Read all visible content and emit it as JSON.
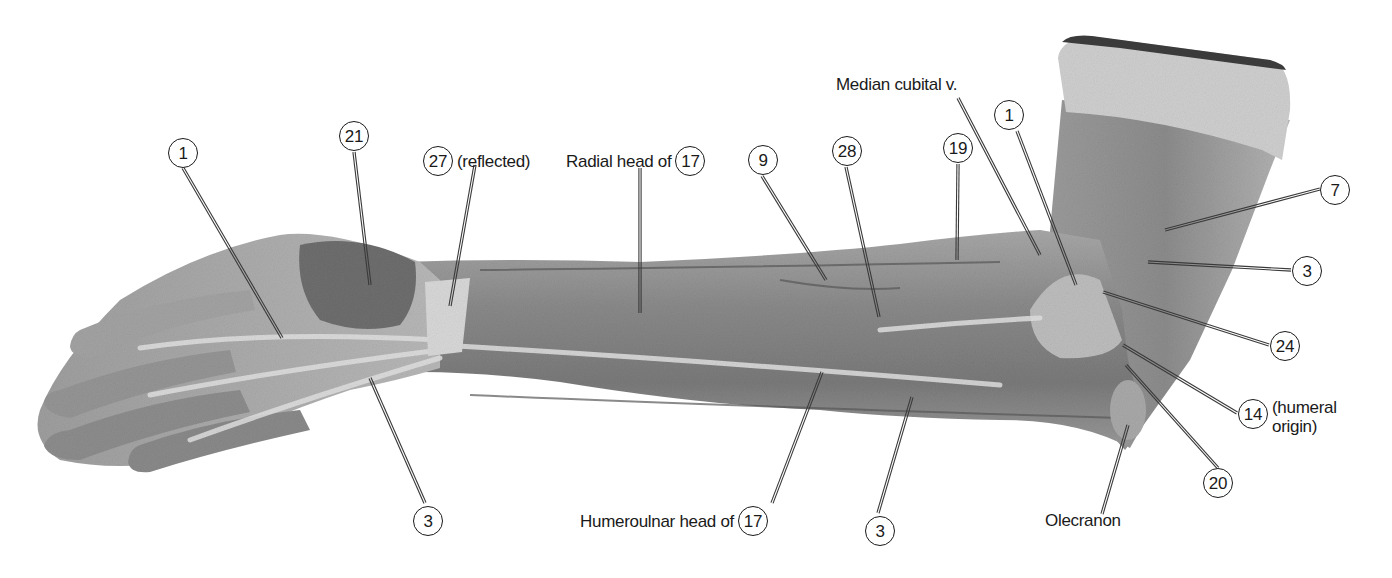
{
  "figure": {
    "type": "anatomical dissection photograph",
    "colors": {
      "background": "#ffffff",
      "tissue_dark": "#6b6b6b",
      "tissue_mid": "#8f8f8f",
      "tissue_light": "#c9c9c9",
      "tendon": "#dcdcdc",
      "label_ink": "#1a1a1a"
    }
  },
  "labels": [
    {
      "id": "l1a",
      "number": "1",
      "prefix": "",
      "suffix": "",
      "x": 168,
      "y": 138
    },
    {
      "id": "l21",
      "number": "21",
      "prefix": "",
      "suffix": "",
      "x": 339,
      "y": 121
    },
    {
      "id": "l27",
      "number": "27",
      "prefix": "",
      "suffix": "(reflected)",
      "x": 423,
      "y": 146
    },
    {
      "id": "l17r",
      "number": "17",
      "prefix": "Radial head of",
      "suffix": "",
      "x": 566,
      "y": 146
    },
    {
      "id": "l9",
      "number": "9",
      "prefix": "",
      "suffix": "",
      "x": 748,
      "y": 145
    },
    {
      "id": "l28",
      "number": "28",
      "prefix": "",
      "suffix": "",
      "x": 832,
      "y": 136
    },
    {
      "id": "l19",
      "number": "19",
      "prefix": "",
      "suffix": "",
      "x": 943,
      "y": 133
    },
    {
      "id": "lmcv",
      "number": "",
      "prefix": "Median cubital v.",
      "suffix": "",
      "x": 836,
      "y": 76
    },
    {
      "id": "l1b",
      "number": "1",
      "prefix": "",
      "suffix": "",
      "x": 994,
      "y": 100
    },
    {
      "id": "l7",
      "number": "7",
      "prefix": "",
      "suffix": "",
      "x": 1320,
      "y": 175
    },
    {
      "id": "l3a",
      "number": "3",
      "prefix": "",
      "suffix": "",
      "x": 1292,
      "y": 256
    },
    {
      "id": "l24",
      "number": "24",
      "prefix": "",
      "suffix": "",
      "x": 1270,
      "y": 331
    },
    {
      "id": "l14",
      "number": "14",
      "prefix": "",
      "suffix": "(humeral\norigin)",
      "x": 1238,
      "y": 399
    },
    {
      "id": "l20",
      "number": "20",
      "prefix": "",
      "suffix": "",
      "x": 1203,
      "y": 468
    },
    {
      "id": "l3b",
      "number": "3",
      "prefix": "",
      "suffix": "",
      "x": 413,
      "y": 506
    },
    {
      "id": "l17h",
      "number": "17",
      "prefix": "Humeroulnar head of",
      "suffix": "",
      "x": 580,
      "y": 506
    },
    {
      "id": "l3c",
      "number": "3",
      "prefix": "",
      "suffix": "",
      "x": 865,
      "y": 516
    },
    {
      "id": "lole",
      "number": "",
      "prefix": "Olecranon",
      "suffix": "",
      "x": 1045,
      "y": 512
    }
  ],
  "leaders": [
    {
      "from": [
        183,
        168
      ],
      "to": [
        282,
        338
      ]
    },
    {
      "from": [
        354,
        152
      ],
      "to": [
        370,
        285
      ]
    },
    {
      "from": [
        475,
        165
      ],
      "to": [
        450,
        306
      ]
    },
    {
      "from": [
        640,
        168
      ],
      "to": [
        640,
        313
      ]
    },
    {
      "from": [
        762,
        176
      ],
      "to": [
        826,
        280
      ]
    },
    {
      "from": [
        846,
        167
      ],
      "to": [
        879,
        317
      ]
    },
    {
      "from": [
        958,
        164
      ],
      "to": [
        957,
        260
      ]
    },
    {
      "from": [
        958,
        98
      ],
      "to": [
        1040,
        255
      ]
    },
    {
      "from": [
        1017,
        131
      ],
      "to": [
        1076,
        285
      ]
    },
    {
      "from": [
        1320,
        189
      ],
      "to": [
        1165,
        230
      ]
    },
    {
      "from": [
        1291,
        270
      ],
      "to": [
        1148,
        262
      ]
    },
    {
      "from": [
        1269,
        345
      ],
      "to": [
        1103,
        292
      ]
    },
    {
      "from": [
        1237,
        413
      ],
      "to": [
        1123,
        345
      ]
    },
    {
      "from": [
        1218,
        468
      ],
      "to": [
        1126,
        365
      ]
    },
    {
      "from": [
        425,
        503
      ],
      "to": [
        370,
        378
      ]
    },
    {
      "from": [
        772,
        503
      ],
      "to": [
        822,
        372
      ]
    },
    {
      "from": [
        878,
        513
      ],
      "to": [
        912,
        397
      ]
    },
    {
      "from": [
        1102,
        514
      ],
      "to": [
        1128,
        425
      ]
    }
  ]
}
